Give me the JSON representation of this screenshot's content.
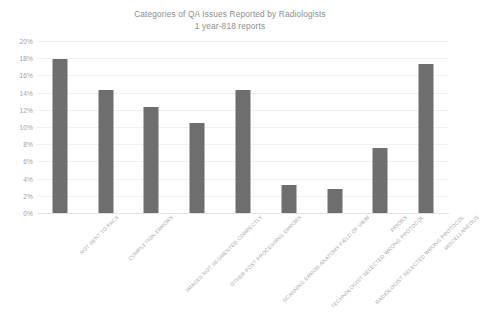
{
  "chart_data": {
    "type": "bar",
    "title": "Categories of QA Issues Reported by Radiologists",
    "subtitle": "1 year-818 reports",
    "xlabel": "",
    "ylabel": "",
    "ylim": [
      0,
      20
    ],
    "ytick_step": 2,
    "ytick_labels": [
      "20%",
      "18%",
      "16%",
      "14%",
      "12%",
      "10%",
      "8%",
      "6%",
      "4%",
      "2%",
      "0%"
    ],
    "ytick_values": [
      20,
      18,
      16,
      14,
      12,
      10,
      8,
      6,
      4,
      2,
      0
    ],
    "grid": true,
    "legend": false,
    "bar_color": "#6e6e6e",
    "value_unit": "%",
    "categories": [
      "NOT SENT TO PACS",
      "COMPLETION ERRORS",
      "IMAGES NOT SEGMENTED CORRECTLY",
      "OTHER POST PROCESSING ERRORS",
      "SCANNING ERROR-ANATOMY FIELD OF VIEW",
      "TECHNOLOGIST SELECTED WRONG PROTOCOL",
      "RADIOLOGIST SELECTED WRONG PROTOCOL",
      "PRIORS",
      "MISCELLANEOUS"
    ],
    "values": [
      17.9,
      14.3,
      12.3,
      10.5,
      14.3,
      3.3,
      2.8,
      7.6,
      17.3
    ]
  }
}
